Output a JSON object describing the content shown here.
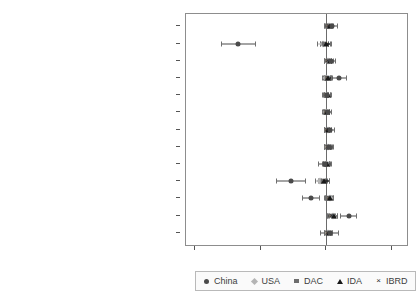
{
  "chart_data": {
    "type": "scatter",
    "title": "",
    "subtitle": "",
    "xlabel": "",
    "ylabel": "",
    "xlim": [
      -10.7,
      6.3
    ],
    "xticks": [
      -10,
      -5,
      0,
      5
    ],
    "xticklabels": [
      "-10",
      "-5",
      "0",
      "5"
    ],
    "grid": false,
    "legend_position": "bottom",
    "orientation": "horizontal",
    "zero_reference_line": 0,
    "categories": [
      "UN voting with China [USA]",
      "Taiwan recognition",
      "Historical probability",
      "Trade with China [USA, DAC] (log)",
      "Oil dummy",
      "Debt/GDP",
      "Stability",
      "Polity",
      "Control of corruption",
      "GDP per capita (log)",
      "Killed from disasters (log)",
      "Population (log)",
      "English language"
    ],
    "series": [
      {
        "name": "China",
        "marker": "circle",
        "color": "#4a4a4a",
        "values": [
          0.45,
          -6.7,
          0.35,
          0.95,
          0.05,
          0.1,
          0.25,
          0.2,
          -0.1,
          -2.7,
          -1.15,
          1.7,
          0.25
        ],
        "ci_low": [
          0.05,
          -8.05,
          0.0,
          0.35,
          -0.3,
          -0.2,
          -0.15,
          -0.15,
          -0.6,
          -3.85,
          -1.85,
          1.05,
          -0.45
        ],
        "ci_high": [
          0.9,
          -5.35,
          0.75,
          1.6,
          0.4,
          0.4,
          0.65,
          0.55,
          0.4,
          -1.55,
          -0.45,
          2.35,
          0.95
        ]
      },
      {
        "name": "USA",
        "marker": "diamond",
        "color": "#b4b4b4",
        "values": [
          0.2,
          -0.25,
          0.15,
          0.0,
          0.05,
          -0.05,
          0.1,
          0.15,
          -0.05,
          -0.45,
          0.25,
          0.5,
          0.15
        ],
        "ci_low": [
          -0.1,
          -0.7,
          -0.15,
          -0.35,
          -0.25,
          -0.35,
          -0.2,
          -0.15,
          -0.35,
          -0.9,
          -0.1,
          0.1,
          -0.2
        ],
        "ci_high": [
          0.5,
          0.2,
          0.45,
          0.35,
          0.35,
          0.25,
          0.4,
          0.45,
          0.25,
          0.0,
          0.6,
          0.9,
          0.5
        ]
      },
      {
        "name": "DAC",
        "marker": "square",
        "color": "#6d6d6d",
        "values": [
          0.1,
          -0.15,
          0.05,
          0.05,
          0.0,
          0.0,
          0.05,
          0.1,
          0.0,
          -0.25,
          0.15,
          0.35,
          0.1
        ],
        "ci_low": [
          -0.15,
          -0.5,
          -0.2,
          -0.25,
          -0.2,
          -0.25,
          -0.2,
          -0.15,
          -0.25,
          -0.6,
          -0.15,
          0.05,
          -0.15
        ],
        "ci_high": [
          0.35,
          0.2,
          0.3,
          0.35,
          0.2,
          0.25,
          0.3,
          0.35,
          0.25,
          0.1,
          0.45,
          0.65,
          0.35
        ]
      },
      {
        "name": "IDA",
        "marker": "triangle",
        "color": "#181818",
        "values": [
          0.3,
          -0.05,
          0.25,
          0.15,
          0.1,
          0.05,
          0.15,
          0.2,
          0.05,
          -0.15,
          0.3,
          0.55,
          0.2
        ],
        "ci_low": [
          0.0,
          -0.45,
          -0.05,
          -0.2,
          -0.15,
          -0.2,
          -0.15,
          -0.1,
          -0.25,
          -0.55,
          0.0,
          0.2,
          -0.1
        ],
        "ci_high": [
          0.6,
          0.35,
          0.55,
          0.5,
          0.35,
          0.3,
          0.45,
          0.5,
          0.35,
          0.25,
          0.6,
          0.9,
          0.5
        ]
      },
      {
        "name": "IBRD",
        "marker": "cross",
        "color": "#2b2b2b",
        "values": [
          0.15,
          0.05,
          0.1,
          0.1,
          0.0,
          0.0,
          0.05,
          0.1,
          0.0,
          -0.05,
          0.2,
          0.4,
          0.1
        ],
        "ci_low": [
          -0.15,
          -0.3,
          -0.2,
          -0.2,
          -0.2,
          -0.25,
          -0.2,
          -0.15,
          -0.25,
          -0.4,
          -0.1,
          0.05,
          -0.2
        ],
        "ci_high": [
          0.45,
          0.4,
          0.4,
          0.4,
          0.2,
          0.25,
          0.3,
          0.35,
          0.25,
          0.3,
          0.5,
          0.75,
          0.4
        ]
      }
    ],
    "legend": [
      {
        "label": "China",
        "marker": "circle"
      },
      {
        "label": "USA",
        "marker": "diamond"
      },
      {
        "label": "DAC",
        "marker": "square"
      },
      {
        "label": "IDA",
        "marker": "triangle"
      },
      {
        "label": "IBRD",
        "marker": "cross"
      }
    ]
  },
  "colors": {
    "background": "#ffffff",
    "axis": "#8d8d8d",
    "text": "#3d3d3d",
    "zero_line": "#6b6b6b",
    "legend_border": "#b9b9b9"
  }
}
